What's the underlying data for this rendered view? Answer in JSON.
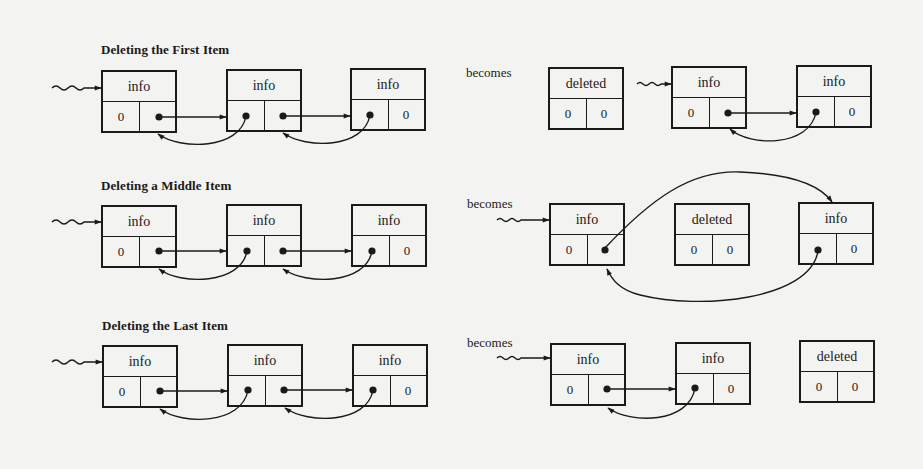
{
  "diagram": {
    "background": "#f3f3f1",
    "ink": "#1a1a1a",
    "connector_word": "becomes",
    "sections": [
      {
        "title": "Deleting the First Item",
        "before": [
          {
            "info": "info",
            "prev": "0",
            "next": "•"
          },
          {
            "info": "info",
            "prev": "•",
            "next": "•"
          },
          {
            "info": "info",
            "prev": "•",
            "next": "0"
          }
        ],
        "after": [
          {
            "info": "deleted",
            "prev": "0",
            "next": "0"
          },
          {
            "info": "info",
            "prev": "0",
            "next": "•"
          },
          {
            "info": "info",
            "prev": "•",
            "next": "0"
          }
        ]
      },
      {
        "title": "Deleting a Middle Item",
        "before": [
          {
            "info": "info",
            "prev": "0",
            "next": "•"
          },
          {
            "info": "info",
            "prev": "•",
            "next": "•"
          },
          {
            "info": "info",
            "prev": "•",
            "next": "0"
          }
        ],
        "after": [
          {
            "info": "info",
            "prev": "0",
            "next": "•"
          },
          {
            "info": "deleted",
            "prev": "0",
            "next": "0"
          },
          {
            "info": "info",
            "prev": "•",
            "next": "0"
          }
        ]
      },
      {
        "title": "Deleting the Last Item",
        "before": [
          {
            "info": "info",
            "prev": "0",
            "next": "•"
          },
          {
            "info": "info",
            "prev": "•",
            "next": "•"
          },
          {
            "info": "info",
            "prev": "•",
            "next": "0"
          }
        ],
        "after": [
          {
            "info": "info",
            "prev": "0",
            "next": "•"
          },
          {
            "info": "info",
            "prev": "•",
            "next": "0"
          },
          {
            "info": "deleted",
            "prev": "0",
            "next": "0"
          }
        ]
      }
    ]
  }
}
